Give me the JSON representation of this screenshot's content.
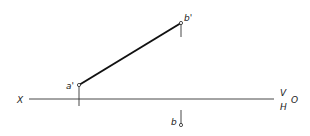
{
  "diagram": {
    "type": "orthographic-projection",
    "axis": {
      "left_label": "X",
      "right_label": "O",
      "upper_plane": "V",
      "lower_plane": "H"
    },
    "points": {
      "a_prime": {
        "label": "a'",
        "x": 79,
        "y": 85
      },
      "b_prime": {
        "label": "b'",
        "x": 181,
        "y": 23
      },
      "b": {
        "label": "b",
        "x": 181,
        "y": 125
      }
    },
    "line_segment": {
      "from": "a'",
      "to": "b'"
    },
    "colors": {
      "ink": "#222222",
      "background": "#ffffff"
    }
  }
}
